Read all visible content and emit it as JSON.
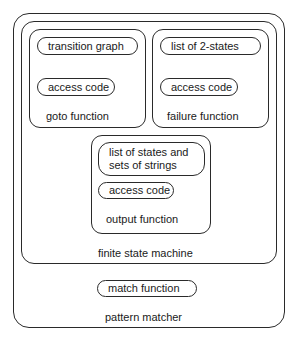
{
  "diagram": {
    "pattern_matcher": {
      "label": "pattern matcher",
      "match_function": "match function"
    },
    "finite_state_machine": {
      "label": "finite state machine",
      "goto_function": {
        "label": "goto function",
        "items": [
          "transition graph",
          "access code"
        ]
      },
      "failure_function": {
        "label": "failure function",
        "items": [
          "list of 2-states",
          "access code"
        ]
      },
      "output_function": {
        "label": "output function",
        "items": [
          "list of states and sets of strings",
          "access code"
        ],
        "item0_lines": [
          "list of states and",
          "sets of strings"
        ]
      }
    }
  }
}
